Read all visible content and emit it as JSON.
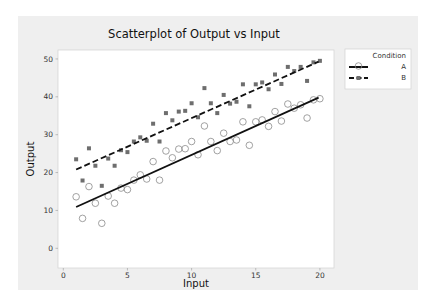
{
  "chart_data": {
    "type": "scatter",
    "title": "Scatterplot of Output vs Input",
    "xlabel": "Input",
    "ylabel": "Output",
    "xlim": [
      0,
      20.8
    ],
    "ylim": [
      0,
      52
    ],
    "xticks": [
      0,
      5,
      10,
      15,
      20
    ],
    "yticks": [
      0,
      10,
      20,
      30,
      40,
      50
    ],
    "grid": false,
    "legend": {
      "title": "Condition",
      "position": "right-top",
      "entries": [
        "A",
        "B"
      ]
    },
    "series": [
      {
        "name": "A",
        "marker": "open-circle",
        "fit_line": {
          "style": "solid",
          "start": [
            1.0,
            10.9
          ],
          "end": [
            19.9,
            39.8
          ]
        },
        "points": [
          [
            1.0,
            13.6
          ],
          [
            1.5,
            7.9
          ],
          [
            2.0,
            16.3
          ],
          [
            2.5,
            11.9
          ],
          [
            3.0,
            6.6
          ],
          [
            3.5,
            13.8
          ],
          [
            4.0,
            11.9
          ],
          [
            4.5,
            15.9
          ],
          [
            5.0,
            15.5
          ],
          [
            5.5,
            18.0
          ],
          [
            6.0,
            19.4
          ],
          [
            6.5,
            18.3
          ],
          [
            7.0,
            22.9
          ],
          [
            7.5,
            18.0
          ],
          [
            8.0,
            25.7
          ],
          [
            8.5,
            23.9
          ],
          [
            9.0,
            26.2
          ],
          [
            9.5,
            26.3
          ],
          [
            10.0,
            28.2
          ],
          [
            10.5,
            24.7
          ],
          [
            11.0,
            32.3
          ],
          [
            11.5,
            28.2
          ],
          [
            12.0,
            25.8
          ],
          [
            12.5,
            30.4
          ],
          [
            13.0,
            28.2
          ],
          [
            13.5,
            28.6
          ],
          [
            14.0,
            33.4
          ],
          [
            14.5,
            27.2
          ],
          [
            15.0,
            33.4
          ],
          [
            15.5,
            33.9
          ],
          [
            16.0,
            32.2
          ],
          [
            16.5,
            36.1
          ],
          [
            17.0,
            33.6
          ],
          [
            17.5,
            38.1
          ],
          [
            18.0,
            37.0
          ],
          [
            18.5,
            37.9
          ],
          [
            19.0,
            34.4
          ],
          [
            19.5,
            39.2
          ],
          [
            20.0,
            39.5
          ]
        ]
      },
      {
        "name": "B",
        "marker": "filled-square",
        "fit_line": {
          "style": "dashed",
          "start": [
            1.0,
            20.8
          ],
          "end": [
            19.9,
            49.3
          ]
        },
        "points": [
          [
            1.0,
            23.5
          ],
          [
            1.5,
            17.9
          ],
          [
            2.0,
            26.4
          ],
          [
            2.5,
            21.8
          ],
          [
            3.0,
            16.5
          ],
          [
            3.5,
            23.7
          ],
          [
            4.0,
            21.8
          ],
          [
            4.5,
            25.9
          ],
          [
            5.0,
            25.4
          ],
          [
            5.5,
            28.2
          ],
          [
            6.0,
            29.3
          ],
          [
            6.5,
            28.4
          ],
          [
            7.0,
            32.9
          ],
          [
            7.5,
            28.2
          ],
          [
            8.0,
            35.7
          ],
          [
            8.5,
            33.8
          ],
          [
            9.0,
            36.1
          ],
          [
            9.5,
            36.3
          ],
          [
            10.0,
            38.3
          ],
          [
            10.5,
            34.6
          ],
          [
            11.0,
            42.3
          ],
          [
            11.5,
            38.3
          ],
          [
            12.0,
            35.7
          ],
          [
            12.5,
            40.5
          ],
          [
            13.0,
            38.2
          ],
          [
            13.5,
            38.7
          ],
          [
            14.0,
            43.3
          ],
          [
            14.5,
            37.5
          ],
          [
            15.0,
            43.3
          ],
          [
            15.5,
            43.8
          ],
          [
            16.0,
            42.0
          ],
          [
            16.5,
            45.9
          ],
          [
            17.0,
            43.4
          ],
          [
            17.5,
            47.9
          ],
          [
            18.0,
            46.8
          ],
          [
            18.5,
            47.9
          ],
          [
            19.0,
            44.2
          ],
          [
            19.5,
            49.1
          ],
          [
            20.0,
            49.5
          ]
        ]
      }
    ]
  },
  "colors": {
    "frame_background": "#efefef",
    "plot_background": "#ffffff",
    "series_a_marker": "#8a8a8a",
    "series_b_marker": "#6e6e6e",
    "fit_line": "#111111"
  }
}
